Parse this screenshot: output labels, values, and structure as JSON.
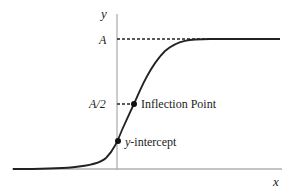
{
  "diagram": {
    "axes": {
      "x_label": "x",
      "y_label": "y"
    },
    "levels": {
      "top_label": "A",
      "half_label": "A/2"
    },
    "points": {
      "inflection_label": "Inflection Point",
      "intercept_prefix": "y",
      "intercept_suffix": "-intercept"
    },
    "colors": {
      "axis": "#aaaaaa",
      "curve": "#222222",
      "dashed": "#222222"
    }
  }
}
